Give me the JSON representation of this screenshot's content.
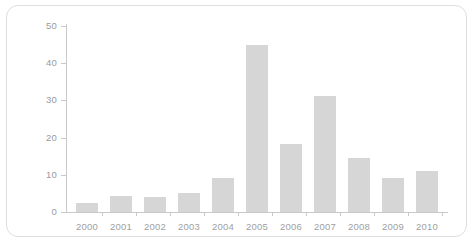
{
  "chart_data": {
    "type": "bar",
    "title": "",
    "subtitle": "",
    "xlabel": "",
    "ylabel": "",
    "categories": [
      "2000",
      "2001",
      "2002",
      "2003",
      "2004",
      "2005",
      "2006",
      "2007",
      "2008",
      "2009",
      "2010"
    ],
    "values": [
      2.5,
      4.2,
      4.1,
      5.0,
      9.2,
      45.0,
      18.3,
      31.3,
      14.5,
      9.2,
      11.0
    ],
    "series": [
      {
        "name": "",
        "values": [
          2.5,
          4.2,
          4.1,
          5.0,
          9.2,
          45.0,
          18.3,
          31.3,
          14.5,
          9.2,
          11.0
        ]
      }
    ],
    "ylim": [
      0,
      50
    ],
    "y_ticks": [
      0,
      10,
      20,
      30,
      40,
      50
    ],
    "y_tick_labels": [
      "0",
      "10",
      "20",
      "30",
      "40",
      "50"
    ],
    "x_tick_labels": [
      "2000",
      "2001",
      "2002",
      "2003",
      "2004",
      "2005",
      "2006",
      "2007",
      "2008",
      "2009",
      "2010"
    ],
    "grid": false,
    "legend": false,
    "legend_position": "none",
    "annotations": [],
    "colors": {
      "bar_fill": "#d6d6d6",
      "axis": "#c9c9c9",
      "tick_text": "#9a9a9a",
      "category_text": "#a0a0a0",
      "card_border": "#dedede",
      "background": "#ffffff"
    }
  }
}
